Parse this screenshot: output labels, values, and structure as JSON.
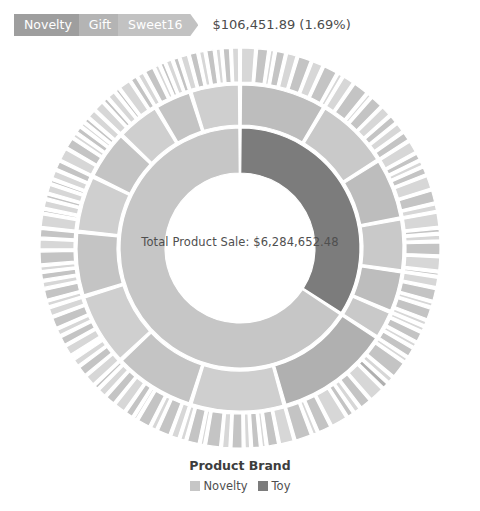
{
  "breadcrumb": {
    "items": [
      {
        "label": "Novelty",
        "color": "#9e9e9e"
      },
      {
        "label": "Gift",
        "color": "#b4b4b4"
      },
      {
        "label": "Sweet16",
        "color": "#c2c2c2"
      }
    ],
    "value_text": "$106,451.89 (1.69%)",
    "amount": "$106,451.89",
    "percent": "1.69%"
  },
  "center": {
    "label": "Total Product Sale: $6,284,652.48",
    "metric_name": "Total Product Sale",
    "metric_value": "$6,284,652.48"
  },
  "legend": {
    "title": "Product Brand",
    "items": [
      {
        "label": "Novelty",
        "color": "#c6c6c6"
      },
      {
        "label": "Toy",
        "color": "#7c7c7c"
      }
    ]
  },
  "chart_data": {
    "type": "pie",
    "subtype": "sunburst",
    "title": "Product Brand",
    "center_total": 6284652.48,
    "center_total_text": "$6,284,652.48",
    "highlighted_path": [
      "Novelty",
      "Gift",
      "Sweet16"
    ],
    "highlighted_value": 106451.89,
    "highlighted_percent": 1.69,
    "geometry": {
      "cx": 240,
      "cy": 248,
      "inner_radius": 75,
      "ring_radii": [
        [
          75,
          120
        ],
        [
          123,
          163
        ],
        [
          166,
          200
        ]
      ],
      "start_angle_deg": 0,
      "gap_deg": 0.55
    },
    "colors": {
      "novelty": "#c6c6c6",
      "toy": "#7c7c7c",
      "ring2_light": "#cfcfcf",
      "ring2_dark": "#bdbdbd",
      "ring3_light": "#d7d7d7",
      "ring3_dark": "#c4c4c4",
      "highlight": "#b0b0b0",
      "separator": "#ffffff"
    },
    "rings": [
      {
        "level": 1,
        "name": "Product Brand",
        "segments": [
          {
            "label": "Toy",
            "percent": 34.2,
            "color": "#7c7c7c"
          },
          {
            "label": "Novelty",
            "percent": 65.8,
            "color": "#c6c6c6"
          }
        ]
      },
      {
        "level": 2,
        "name": "Product Category",
        "segments": [
          {
            "parent": "Toy",
            "label": "Games",
            "percent": 8.6,
            "color": "#bdbdbd"
          },
          {
            "parent": "Toy",
            "label": "Plush",
            "percent": 7.4,
            "color": "#c9c9c9"
          },
          {
            "parent": "Toy",
            "label": "Puzzles",
            "percent": 6.1,
            "color": "#bdbdbd"
          },
          {
            "parent": "Toy",
            "label": "Vehicles",
            "percent": 5.2,
            "color": "#c9c9c9"
          },
          {
            "parent": "Toy",
            "label": "Figures",
            "percent": 4.1,
            "color": "#bdbdbd"
          },
          {
            "parent": "Toy",
            "label": "Outdoor",
            "percent": 2.8,
            "color": "#c9c9c9"
          },
          {
            "parent": "Novelty",
            "label": "Gift",
            "percent": 11.4,
            "color": "#b0b0b0"
          },
          {
            "parent": "Novelty",
            "label": "Party",
            "percent": 9.3,
            "color": "#cfcfcf"
          },
          {
            "parent": "Novelty",
            "label": "Seasonal",
            "percent": 8.1,
            "color": "#c4c4c4"
          },
          {
            "parent": "Novelty",
            "label": "Souvenir",
            "percent": 7.2,
            "color": "#cfcfcf"
          },
          {
            "parent": "Novelty",
            "label": "Stationery",
            "percent": 6.4,
            "color": "#c4c4c4"
          },
          {
            "parent": "Novelty",
            "label": "Decor",
            "percent": 5.6,
            "color": "#cfcfcf"
          },
          {
            "parent": "Novelty",
            "label": "Candy",
            "percent": 4.9,
            "color": "#c4c4c4"
          },
          {
            "parent": "Novelty",
            "label": "Apparel",
            "percent": 4.3,
            "color": "#cfcfcf"
          },
          {
            "parent": "Novelty",
            "label": "Misc",
            "percent": 3.7,
            "color": "#c4c4c4"
          },
          {
            "parent": "Novelty",
            "label": "Other",
            "percent": 4.9,
            "color": "#cfcfcf"
          }
        ]
      },
      {
        "level": 3,
        "name": "Product Name",
        "segment_counts": [
          {
            "parent": "Games",
            "count": 9
          },
          {
            "parent": "Plush",
            "count": 8
          },
          {
            "parent": "Puzzles",
            "count": 7
          },
          {
            "parent": "Vehicles",
            "count": 6
          },
          {
            "parent": "Figures",
            "count": 5
          },
          {
            "parent": "Outdoor",
            "count": 4
          },
          {
            "parent": "Gift",
            "count": 12
          },
          {
            "parent": "Party",
            "count": 11
          },
          {
            "parent": "Seasonal",
            "count": 10
          },
          {
            "parent": "Souvenir",
            "count": 9
          },
          {
            "parent": "Stationery",
            "count": 8
          },
          {
            "parent": "Decor",
            "count": 8
          },
          {
            "parent": "Candy",
            "count": 7
          },
          {
            "parent": "Apparel",
            "count": 6
          },
          {
            "parent": "Misc",
            "count": 6
          },
          {
            "parent": "Other",
            "count": 7
          }
        ],
        "highlight": {
          "parent": "Gift",
          "label": "Sweet16",
          "index": 3,
          "color": "#b0b0b0"
        }
      }
    ]
  }
}
